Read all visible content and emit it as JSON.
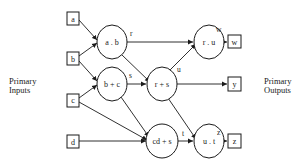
{
  "labels": {
    "inputs_line1": "Primary",
    "inputs_line2": "Inputs",
    "outputs_line1": "Primary",
    "outputs_line2": "Outputs"
  },
  "inputs": [
    {
      "id": "a",
      "label": "a"
    },
    {
      "id": "b",
      "label": "b"
    },
    {
      "id": "c",
      "label": "c"
    },
    {
      "id": "d",
      "label": "d"
    }
  ],
  "gates": [
    {
      "id": "g_ab",
      "label": "a . b",
      "output": "r"
    },
    {
      "id": "g_bc",
      "label": "b + c",
      "output": "s"
    },
    {
      "id": "g_rs",
      "label": "r + s",
      "output": "u"
    },
    {
      "id": "g_cds",
      "label": "cd + s",
      "output": "t"
    },
    {
      "id": "g_ru",
      "label": "r . u",
      "output": "w"
    },
    {
      "id": "g_ut",
      "label": "u . t",
      "output": "z"
    }
  ],
  "outputs": [
    {
      "id": "w",
      "label": "w"
    },
    {
      "id": "y",
      "label": "y"
    },
    {
      "id": "z",
      "label": "z"
    }
  ],
  "edge_labels": {
    "r": "r",
    "s": "s",
    "u": "u",
    "t": "t",
    "w": "w",
    "z": "z"
  },
  "colors": {
    "stroke": "#1a1a1a",
    "background": "#ffffff"
  }
}
